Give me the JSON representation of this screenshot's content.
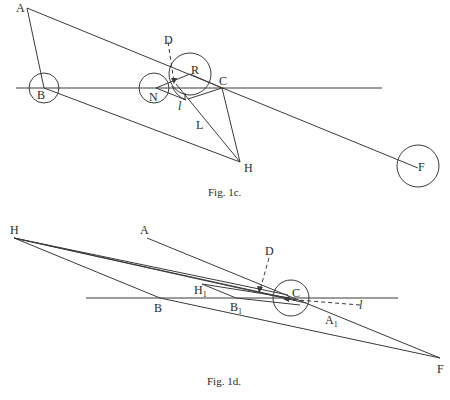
{
  "figures": [
    {
      "caption": "Fig. 1c.",
      "labels": {
        "A": "A",
        "B": "B",
        "D": "D",
        "R": "R",
        "N": "N",
        "C": "C",
        "l": "l",
        "L": "L",
        "H": "H",
        "F": "F"
      }
    },
    {
      "caption": "Fig. 1d.",
      "labels": {
        "H": "H",
        "A": "A",
        "D": "D",
        "H1": "H",
        "H1_sub": "1",
        "B": "B",
        "B1": "B",
        "B1_sub": "1",
        "C": "C",
        "l": "l",
        "A1": "A",
        "A1_sub": "1",
        "F": "F"
      }
    }
  ],
  "colors": {
    "ink": "#3a3a3a",
    "background": "#ffffff"
  }
}
